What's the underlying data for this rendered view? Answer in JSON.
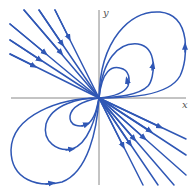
{
  "figure": {
    "type": "phase-portrait",
    "axes": {
      "x_label": "x",
      "y_label": "y"
    },
    "colors": {
      "trajectory": "#2f57b5",
      "axis": "#888888",
      "label": "#555555"
    },
    "origin_px": [
      99,
      98
    ],
    "trajectories": {
      "upper_left_lines": 6,
      "lower_right_lines": 6,
      "upper_right_loops": 3,
      "lower_left_loops": 3
    }
  }
}
